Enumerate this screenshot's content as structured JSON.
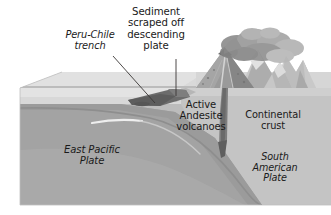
{
  "figure": {
    "background_color": "#ffffff"
  },
  "labels": {
    "sediment": "Sediment\nscraped off\ndescending\nplate",
    "trench": "Peru-Chile\ntrench",
    "volcanoes": "Active\nAndesite\nvolcanoes",
    "continental_crust": "Continental\ncrust",
    "east_pacific_plate": "East Pacific\nPlate",
    "south_american_plate": "South\nAmerican\nPlate"
  },
  "colors": {
    "text": "#1a1a1a",
    "leader_line": "#33302e",
    "top_surface_light": "#e9e9e9",
    "top_surface_mid": "#dcdcdc",
    "ocean_layer": "#d2d2d2",
    "upper_mantle": "#b9b9b9",
    "lower_mantle": "#a8a8a8",
    "oceanic_slab": "#9d9d9d",
    "continental_crust_fill": "#c6c6c6",
    "sediment_wedge": "#6e6e6e",
    "magma_conduit": "#7a7a7a",
    "volcano_cone": "#8f8f8f",
    "mountain_ridge": "#bdbdbd",
    "mountain_shadow": "#9a9a9a",
    "ash_plume": "#9b9b9b",
    "highlight_streak": "#f2f2f2"
  },
  "features": {
    "volcano": "erupting-andesite-volcano",
    "ash_plume": "volcanic-ash-cloud",
    "mountains": "andes-mountain-range",
    "trench": "oceanic-trench",
    "slab": "subducting-oceanic-plate",
    "conduit": "rising-magma-conduit",
    "accretionary_wedge": "scraped-sediment-wedge"
  }
}
